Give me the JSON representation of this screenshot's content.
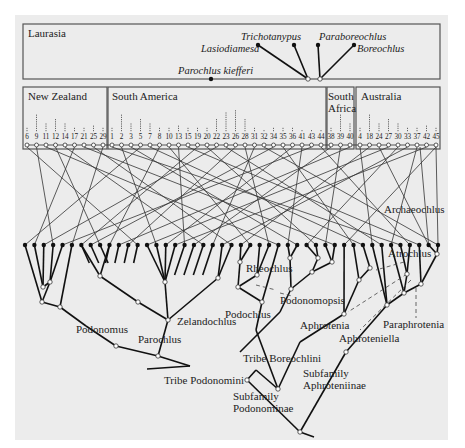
{
  "figure": {
    "background": "#ececec",
    "regions": [
      {
        "name": "Laurasia",
        "label": "Laurasia"
      },
      {
        "name": "New Zealand",
        "label": "New Zealand"
      },
      {
        "name": "South America",
        "label": "South America"
      },
      {
        "name": "South Africa",
        "label_line1": "South",
        "label_line2": "Africa"
      },
      {
        "name": "Australia",
        "label": "Australia"
      }
    ],
    "laurasian_taxa": [
      {
        "label": "Trichotanypus"
      },
      {
        "label": "Paraboreochlus"
      },
      {
        "label": "Lasiodiamesa"
      },
      {
        "label": "Boreochlus"
      },
      {
        "label": "Parochlus kiefferi"
      }
    ],
    "area_numbers": {
      "new_zealand": [
        "6",
        "9",
        "11",
        "12",
        "14",
        "17",
        "21",
        "25",
        "29"
      ],
      "south_america": [
        "1",
        "2",
        "3",
        "5",
        "7",
        "8",
        "10",
        "13",
        "15",
        "19",
        "20",
        "22",
        "23",
        "26",
        "28",
        "31",
        "32",
        "34",
        "35",
        "36",
        "41",
        "43",
        "44"
      ],
      "south_africa": [
        "38",
        "39",
        "40"
      ],
      "australia": [
        "4",
        "18",
        "24",
        "27",
        "30",
        "33",
        "37",
        "42",
        "45"
      ]
    },
    "clade_labels": {
      "archaeochlus": "Archaeochlus",
      "atrochlus": "Atrochlus",
      "rheochlus": "Rheochlus",
      "podonomopsis": "Podonomopsis",
      "podochlus": "Podochlus",
      "aphrotenia": "Aphrotenia",
      "paraphrotenia": "Paraphrotenia",
      "aphroteniella": "Aphroteniella",
      "podonomus": "Podonomus",
      "zelandochlus": "Zelandochlus",
      "parochlus": "Parochlus",
      "tribe_boreochlini": "Tribe Boreochlini",
      "tribe_podonomini": "Tribe Podonomini",
      "subfamily_aphroteniinae_1": "Subfamily",
      "subfamily_aphroteniinae_2": "Aphroteniinae",
      "subfamily_podonominae_1": "Subfamily",
      "subfamily_podonominae_2": "Podonominae"
    },
    "colors": {
      "ink": "#111111",
      "panel_border": "#555555",
      "background": "#ececec"
    }
  }
}
